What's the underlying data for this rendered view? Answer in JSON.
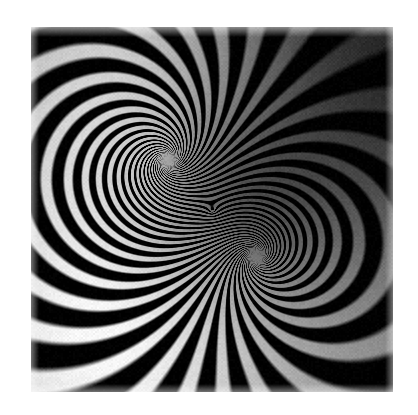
{
  "page": {
    "width": 418,
    "height": 415,
    "background_color": "#ffffff",
    "media_type": "grayscale raster image",
    "caption": ""
  },
  "artwork": {
    "name": "dipole-spiral-moire",
    "description": "Grayscale op-art pattern of black spiral bands radiating between two singular centers, with a soft diagonal illumination gradient and halftone dither grain.",
    "frame": {
      "x": 31,
      "y": 27,
      "width": 362,
      "height": 365,
      "border_color": "#ffffff",
      "base_color": "#9a9a9a"
    },
    "colors": {
      "stripe_dark": "#050505",
      "stripe_light_mid": "#a8a8a8",
      "highlight_white": "#fdfdfd",
      "shadow_dark": "#3e3e3e",
      "field_mid": "#8c8c8c",
      "page_background": "#ffffff"
    },
    "singularities": [
      {
        "name": "upper-left-spiral-core",
        "x": 168,
        "y": 160,
        "charge": 1,
        "note": "clockwise winding core"
      },
      {
        "name": "lower-right-spiral-core",
        "x": 256,
        "y": 256,
        "charge": -1,
        "note": "counter-winding core"
      }
    ],
    "fan_points": [
      {
        "name": "upper-right-fan-node",
        "x": 251,
        "y": 168
      },
      {
        "name": "lower-left-fan-node",
        "x": 175,
        "y": 250
      }
    ],
    "pattern": {
      "band_count": 26,
      "spiral_twist": 2.35,
      "grain_amount": 0.2,
      "grain_cell": 2
    },
    "illumination": {
      "bright_zone": {
        "x": 150,
        "y": 70,
        "label": "top-center-left highlight"
      },
      "bright_zone_2": {
        "x": 110,
        "y": 340,
        "label": "lower-left highlight"
      },
      "dark_zone": {
        "x": 345,
        "y": 70,
        "label": "upper-right shadow"
      },
      "dark_zone_2": {
        "x": 230,
        "y": 205,
        "label": "central waist shadow"
      },
      "gradient_axis_degrees": 135
    }
  }
}
